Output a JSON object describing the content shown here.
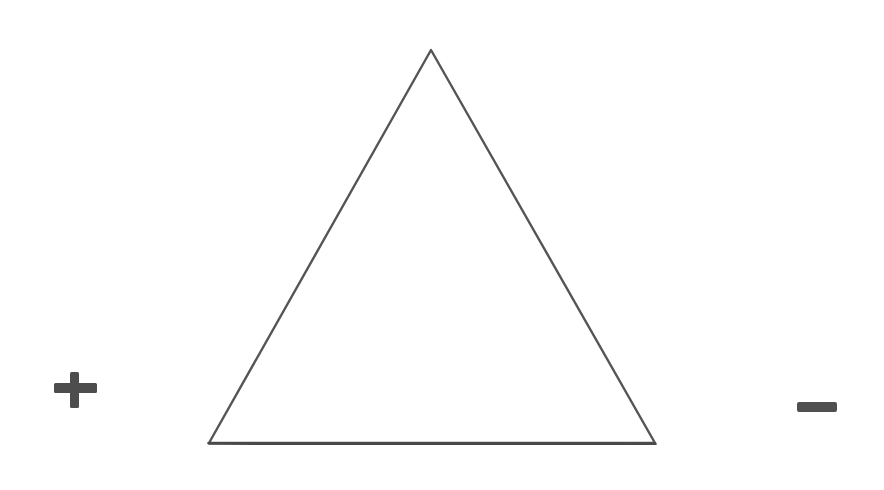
{
  "diagram": {
    "stroke_color": "#4a4a4a",
    "background": "#ffffff",
    "triangle": {
      "apex": [
        431,
        50
      ],
      "bottom_left": [
        209,
        443
      ],
      "bottom_right": [
        655,
        443
      ]
    },
    "symbols": [
      {
        "name": "plus-sign",
        "glyph": "+",
        "center": [
          75,
          390
        ]
      },
      {
        "name": "minus-sign",
        "glyph": "−",
        "center": [
          816,
          407
        ]
      }
    ]
  }
}
